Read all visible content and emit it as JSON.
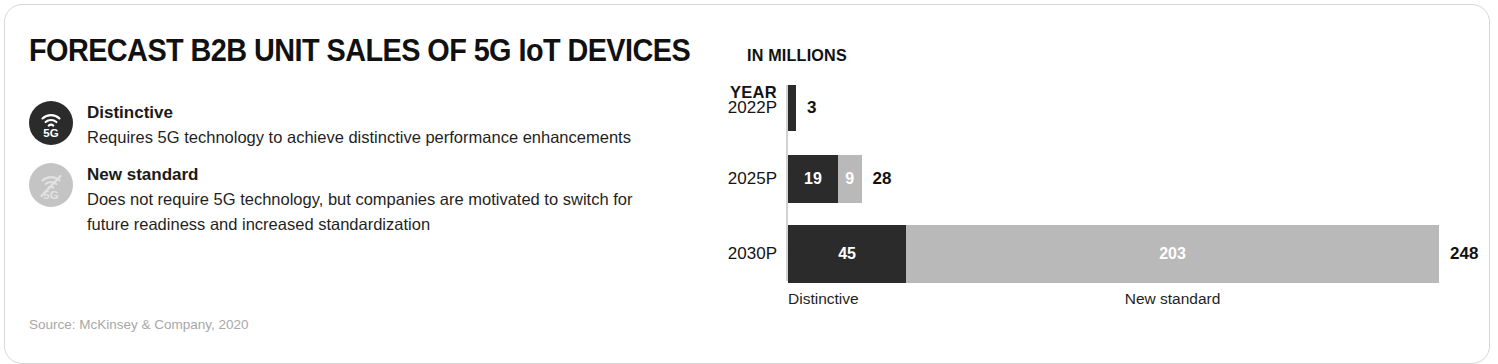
{
  "card": {
    "title_main": "FORECAST B2B UNIT SALES OF 5G IoT DEVICES",
    "title_sub": "IN MILLIONS",
    "source": "Source: McKinsey & Company, 2020"
  },
  "legend": {
    "items": [
      {
        "icon": "5g-signal-icon",
        "icon_label": "5G",
        "title": "Distinctive",
        "description": "Requires 5G technology to achieve distinctive performance enhancements",
        "color": "#2b2b2b"
      },
      {
        "icon": "5g-signal-crossed-out-icon",
        "icon_label": "5G",
        "title": "New standard",
        "description": "Does not require 5G technology, but companies are motivated to switch for future readiness and increased standardization",
        "color": "#c4c4c4"
      }
    ]
  },
  "chart": {
    "year_header": "YEAR",
    "category_labels": {
      "distinctive": "Distinctive",
      "new_standard": "New standard"
    }
  },
  "chart_data": {
    "type": "bar",
    "orientation": "horizontal",
    "stacked": true,
    "title": "FORECAST B2B UNIT SALES OF 5G IoT DEVICES",
    "subtitle": "IN MILLIONS",
    "xlabel": "",
    "ylabel": "YEAR",
    "categories": [
      "2022P",
      "2025P",
      "2030P"
    ],
    "series": [
      {
        "name": "Distinctive",
        "color": "#2b2b2b",
        "values": [
          3,
          19,
          45
        ]
      },
      {
        "name": "New standard",
        "color": "#b9b9b9",
        "values": [
          0,
          9,
          203
        ]
      }
    ],
    "totals": [
      3,
      28,
      248
    ],
    "total_labels": [
      "3",
      "28",
      "248"
    ],
    "segment_labels": [
      {
        "distinctive": "3",
        "new_standard": ""
      },
      {
        "distinctive": "19",
        "new_standard": "9"
      },
      {
        "distinctive": "45",
        "new_standard": "203"
      }
    ],
    "xlim": [
      0,
      248
    ],
    "grid": false,
    "legend_position": "left-panel",
    "units": "millions of units",
    "note": "Values for 2022P, 2025P and 2030P are projections (P = projected)"
  }
}
